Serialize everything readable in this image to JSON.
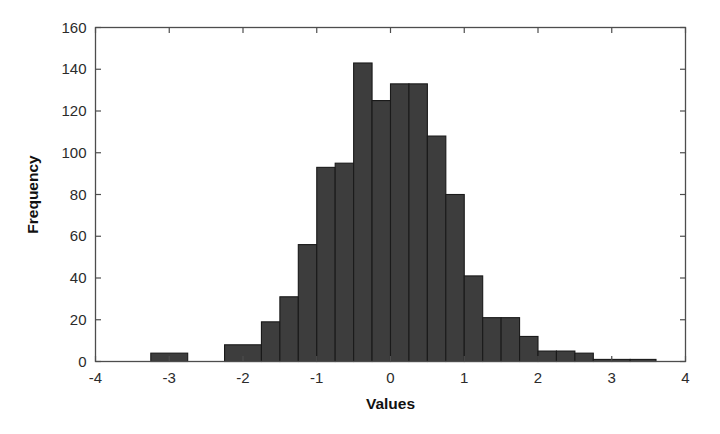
{
  "chart_data": {
    "type": "bar",
    "title": "",
    "xlabel": "Values",
    "ylabel": "Frequency",
    "xlim": [
      -4,
      4
    ],
    "ylim": [
      0,
      160
    ],
    "xticks": [
      -4,
      -3,
      -2,
      -1,
      0,
      1,
      2,
      3,
      4
    ],
    "xticklabels": [
      "-4",
      "-3",
      "-2",
      "-1",
      "0",
      "1",
      "2",
      "3",
      "4"
    ],
    "yticks": [
      0,
      20,
      40,
      60,
      80,
      100,
      120,
      140,
      160
    ],
    "yticklabels": [
      "0",
      "20",
      "40",
      "60",
      "80",
      "100",
      "120",
      "140",
      "160"
    ],
    "grid": false,
    "legend": null,
    "bar_color": "#3d3d3d",
    "bar_edge_color": "#1a1a1a",
    "bin_width": 0.5,
    "bin_edges": [
      -3.25,
      -2.75,
      -2.25,
      -1.75,
      -1.25,
      -0.75,
      -0.25,
      0.25,
      0.75,
      1.25,
      1.75,
      2.25,
      2.75,
      3.25,
      3.75
    ],
    "bins": [
      {
        "left": -3.25,
        "right": -2.75,
        "center": -3.0,
        "value": 4
      },
      {
        "left": -2.75,
        "right": -2.25,
        "center": -2.5,
        "value": 0
      },
      {
        "left": -2.25,
        "right": -1.75,
        "center": -2.0,
        "value": 8
      },
      {
        "left": -1.75,
        "right": -1.5,
        "center": -1.625,
        "value": 19
      },
      {
        "left": -1.5,
        "right": -1.25,
        "center": -1.375,
        "value": 31
      },
      {
        "left": -1.25,
        "right": -1.0,
        "center": -1.125,
        "value": 56
      },
      {
        "left": -1.0,
        "right": -0.75,
        "center": -0.875,
        "value": 93
      },
      {
        "left": -0.75,
        "right": -0.5,
        "center": -0.625,
        "value": 95
      },
      {
        "left": -0.5,
        "right": -0.25,
        "center": -0.375,
        "value": 143
      },
      {
        "left": -0.25,
        "right": 0.0,
        "center": -0.125,
        "value": 125
      },
      {
        "left": 0.0,
        "right": 0.25,
        "center": 0.125,
        "value": 133
      },
      {
        "left": 0.25,
        "right": 0.5,
        "center": 0.375,
        "value": 133
      },
      {
        "left": 0.5,
        "right": 0.75,
        "center": 0.625,
        "value": 108
      },
      {
        "left": 0.75,
        "right": 1.0,
        "center": 0.875,
        "value": 80
      },
      {
        "left": 1.0,
        "right": 1.25,
        "center": 1.125,
        "value": 41
      },
      {
        "left": 1.25,
        "right": 1.5,
        "center": 1.375,
        "value": 21
      },
      {
        "left": 1.5,
        "right": 1.75,
        "center": 1.625,
        "value": 21
      },
      {
        "left": 1.75,
        "right": 2.0,
        "center": 1.875,
        "value": 12
      },
      {
        "left": 2.0,
        "right": 2.25,
        "center": 2.125,
        "value": 5
      },
      {
        "left": 2.25,
        "right": 2.5,
        "center": 2.375,
        "value": 5
      },
      {
        "left": 2.5,
        "right": 2.75,
        "center": 2.625,
        "value": 4
      },
      {
        "left": 2.75,
        "right": 3.0,
        "center": 2.875,
        "value": 1
      },
      {
        "left": 3.0,
        "right": 3.25,
        "center": 3.125,
        "value": 1
      },
      {
        "left": 3.25,
        "right": 3.6,
        "center": 3.425,
        "value": 1
      }
    ],
    "categories": [
      "-3.0",
      "-2.5",
      "-2.0",
      "-1.625",
      "-1.375",
      "-1.125",
      "-0.875",
      "-0.625",
      "-0.375",
      "-0.125",
      "0.125",
      "0.375",
      "0.625",
      "0.875",
      "1.125",
      "1.375",
      "1.625",
      "1.875",
      "2.125",
      "2.375",
      "2.625",
      "2.875",
      "3.125",
      "3.425"
    ],
    "values": [
      4,
      0,
      8,
      19,
      31,
      56,
      93,
      95,
      143,
      125,
      133,
      133,
      108,
      80,
      41,
      21,
      21,
      12,
      5,
      5,
      4,
      1,
      1,
      1
    ]
  }
}
